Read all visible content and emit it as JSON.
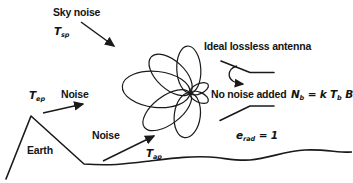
{
  "figure": {
    "labels": {
      "sky_noise": "Sky noise",
      "ideal_antenna": "Ideal lossless antenna",
      "noise_left": "Noise",
      "noise_bottom": "Noise",
      "no_noise_added": "No noise added",
      "earth": "Earth"
    },
    "symbols": {
      "t_sky": {
        "base": "T",
        "sub": "sp"
      },
      "t_left": {
        "base": "T",
        "sub": "ep"
      },
      "t_bottom": {
        "base": "T",
        "sub": "ap"
      },
      "efficiency": {
        "base": "e",
        "sub": "rad",
        "rest": " = 1"
      },
      "formula": {
        "n": "N",
        "n_sub": "b",
        "eq": " = ",
        "k": "k",
        "t": "T",
        "t_sub": "b",
        "b": "B"
      }
    },
    "icons": [
      "antenna-pattern",
      "antenna-feed-symbol",
      "wave-arrow",
      "sky-noise-arrow",
      "earth-noise-arrow",
      "ground-noise-arrow",
      "earth-outline"
    ],
    "colors": {
      "ink": "#1a1a1a",
      "background": "#ffffff"
    }
  }
}
